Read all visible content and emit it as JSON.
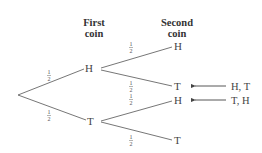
{
  "headers": {
    "first": {
      "line1": "First",
      "line2": "coin"
    },
    "second": {
      "line1": "Second",
      "line2": "coin"
    }
  },
  "tree": {
    "root": "",
    "level1": [
      {
        "label": "H",
        "prob": "1/2",
        "prob_num": "1",
        "prob_den": "2"
      },
      {
        "label": "T",
        "prob": "1/2",
        "prob_num": "1",
        "prob_den": "2"
      }
    ],
    "level2": [
      {
        "parent": "H",
        "label": "H",
        "prob_num": "1",
        "prob_den": "2"
      },
      {
        "parent": "H",
        "label": "T",
        "prob_num": "1",
        "prob_den": "2",
        "outcome": "H, T",
        "highlighted": true
      },
      {
        "parent": "T",
        "label": "H",
        "prob_num": "1",
        "prob_den": "2",
        "outcome": "T, H",
        "highlighted": true
      },
      {
        "parent": "T",
        "label": "T",
        "prob_num": "1",
        "prob_den": "2"
      }
    ]
  },
  "annotations": [
    {
      "text": "H, T",
      "points_to": "level2.1"
    },
    {
      "text": "T, H",
      "points_to": "level2.2"
    }
  ],
  "colors": {
    "line": "#555555",
    "text": "#444444",
    "background": "#ffffff"
  }
}
